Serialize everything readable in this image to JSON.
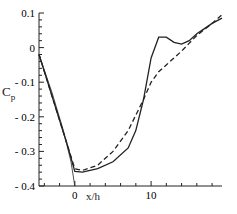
{
  "chart_data": {
    "type": "line",
    "title": "",
    "xlabel": "x/h",
    "ylabel": "Cp",
    "xlim": [
      -4.7,
      19.3
    ],
    "ylim": [
      -0.4,
      0.1
    ],
    "xticks": [
      0,
      10
    ],
    "yticks": [
      0.1,
      0,
      -0.1,
      -0.2,
      -0.3,
      -0.4
    ],
    "ytick_labels": [
      "0.1",
      "0",
      "- 0.1",
      "- 0.2",
      "- 0.3",
      "- 0.4"
    ],
    "grid": false,
    "series": [
      {
        "name": "solid",
        "style": "solid",
        "x": [
          -4.7,
          -3,
          -1,
          0,
          1,
          3,
          5,
          7,
          8,
          9,
          10,
          11,
          12,
          13,
          14,
          15,
          16,
          17,
          18,
          19.3
        ],
        "y": [
          -0.02,
          -0.14,
          -0.28,
          -0.358,
          -0.36,
          -0.35,
          -0.33,
          -0.29,
          -0.24,
          -0.15,
          -0.03,
          0.03,
          0.03,
          0.015,
          0.01,
          0.02,
          0.04,
          0.055,
          0.07,
          0.085
        ]
      },
      {
        "name": "dashed",
        "style": "dashed",
        "x": [
          -4.7,
          -3,
          -1,
          0,
          1,
          3,
          5,
          7,
          9,
          10,
          11,
          12,
          14,
          16,
          18,
          19.3
        ],
        "y": [
          -0.02,
          -0.14,
          -0.28,
          -0.35,
          -0.355,
          -0.34,
          -0.3,
          -0.24,
          -0.15,
          -0.1,
          -0.07,
          -0.05,
          -0.01,
          0.035,
          0.07,
          0.095
        ]
      },
      {
        "name": "thin",
        "style": "solid-thin",
        "x": [
          -4.7,
          -3,
          -1.5,
          -0.5,
          0
        ],
        "y": [
          -0.02,
          -0.13,
          -0.24,
          -0.33,
          -0.4
        ]
      }
    ]
  }
}
